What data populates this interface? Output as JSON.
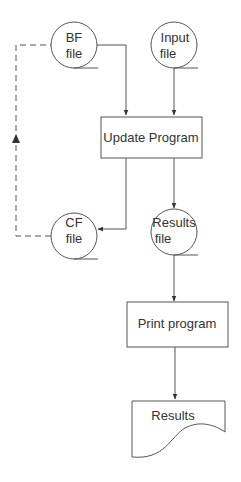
{
  "diagram": {
    "type": "flowchart",
    "colors": {
      "line": "#555555",
      "text": "#333333",
      "background": "#ffffff"
    },
    "nodes": {
      "bf_file": {
        "shape": "file-circle",
        "line1": "BF",
        "line2": "file"
      },
      "input_file": {
        "shape": "file-circle",
        "line1": "Input",
        "line2": "file"
      },
      "update_program": {
        "shape": "process-box",
        "label": "Update Program"
      },
      "cf_file": {
        "shape": "file-circle",
        "line1": "CF",
        "line2": "file"
      },
      "results_file": {
        "shape": "file-circle",
        "line1": "Results",
        "line2": "file"
      },
      "print_program": {
        "shape": "process-box",
        "label": "Print program"
      },
      "results_doc": {
        "shape": "document",
        "label": "Results"
      }
    },
    "edges": [
      {
        "from": "bf_file",
        "to": "update_program",
        "style": "solid"
      },
      {
        "from": "input_file",
        "to": "update_program",
        "style": "solid"
      },
      {
        "from": "update_program",
        "to": "cf_file",
        "style": "solid"
      },
      {
        "from": "update_program",
        "to": "results_file",
        "style": "solid"
      },
      {
        "from": "results_file",
        "to": "print_program",
        "style": "solid"
      },
      {
        "from": "print_program",
        "to": "results_doc",
        "style": "solid"
      },
      {
        "from": "cf_file",
        "to": "bf_file",
        "style": "dashed"
      }
    ]
  }
}
